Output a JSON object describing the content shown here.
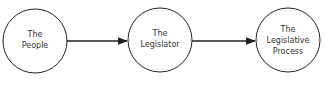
{
  "diagram": {
    "type": "flow",
    "nodes": [
      {
        "id": "people",
        "lines": [
          "The",
          "People"
        ]
      },
      {
        "id": "legislator",
        "lines": [
          "The",
          "Legislator"
        ]
      },
      {
        "id": "process",
        "lines": [
          "The",
          "Legislative",
          "Process"
        ]
      }
    ],
    "edges": [
      {
        "from": "people",
        "to": "legislator"
      },
      {
        "from": "legislator",
        "to": "process"
      }
    ]
  },
  "colors": {
    "stroke": "#222222",
    "text": "#333333",
    "background": "#ffffff"
  }
}
